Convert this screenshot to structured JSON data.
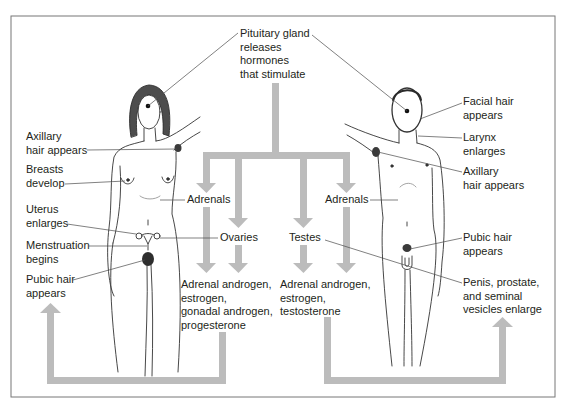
{
  "diagram": {
    "pituitary": {
      "lines": [
        "Pituitary gland",
        "releases",
        "hormones",
        "that stimulate"
      ]
    },
    "glands": {
      "female_adrenals": "Adrenals",
      "ovaries": "Ovaries",
      "testes": "Testes",
      "male_adrenals": "Adrenals"
    },
    "hormones": {
      "female": [
        "Adrenal androgen,",
        "estrogen,",
        "gonadal androgen,",
        "progesterone"
      ],
      "male": [
        "Adrenal androgen,",
        "estrogen,",
        "testosterone"
      ]
    },
    "female_changes": [
      {
        "lines": [
          "Axillary",
          "hair appears"
        ]
      },
      {
        "lines": [
          "Breasts",
          "develop"
        ]
      },
      {
        "lines": [
          "Uterus",
          "enlarges"
        ]
      },
      {
        "lines": [
          "Menstruation",
          "begins"
        ]
      },
      {
        "lines": [
          "Pubic hair",
          "appears"
        ]
      }
    ],
    "male_changes": [
      {
        "lines": [
          "Facial hair",
          "appears"
        ]
      },
      {
        "lines": [
          "Larynx",
          "enlarges"
        ]
      },
      {
        "lines": [
          "Axillary",
          "hair appears"
        ]
      },
      {
        "lines": [
          "Pubic hair",
          "appears"
        ]
      },
      {
        "lines": [
          "Penis, prostate,",
          "and seminal",
          "vesicles enlarge"
        ]
      }
    ]
  },
  "colors": {
    "arrow": "#bcbcbc",
    "leader_line": "#4a4a4a",
    "frame": "#777777",
    "figure_outline": "#333333",
    "text": "#231f20"
  }
}
